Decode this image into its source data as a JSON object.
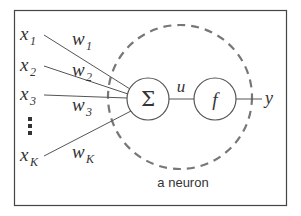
{
  "diagram": {
    "title": "a neuron",
    "inputs": [
      {
        "base": "x",
        "sub": "1",
        "weight_base": "w",
        "weight_sub": "1"
      },
      {
        "base": "x",
        "sub": "2",
        "weight_base": "w",
        "weight_sub": "2"
      },
      {
        "base": "x",
        "sub": "3",
        "weight_base": "w",
        "weight_sub": "3"
      },
      {
        "base": "x",
        "sub": "K",
        "weight_base": "w",
        "weight_sub": "K"
      }
    ],
    "ellipsis": "⋮",
    "summation_symbol": "Σ",
    "intermediate_label": "u",
    "activation_symbol": "f",
    "output_label": "y",
    "colors": {
      "line": "#555555",
      "dashed_circle": "#777777",
      "border": "#444444",
      "text": "#333333"
    }
  }
}
